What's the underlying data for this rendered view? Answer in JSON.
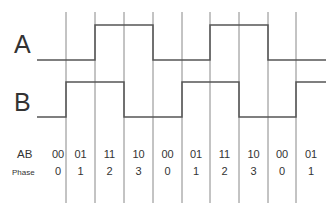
{
  "diagram": {
    "signals": [
      {
        "name": "A",
        "levels": [
          0,
          0,
          1,
          1,
          0,
          0,
          1,
          1,
          0,
          0
        ]
      },
      {
        "name": "B",
        "levels": [
          0,
          1,
          1,
          0,
          0,
          1,
          1,
          0,
          0,
          1
        ]
      }
    ],
    "rows": {
      "ab_label": "AB",
      "phase_label": "Phase",
      "ab_values": [
        "00",
        "01",
        "11",
        "10",
        "00",
        "01",
        "11",
        "10",
        "00",
        "01"
      ],
      "phase_values": [
        "0",
        "1",
        "2",
        "3",
        "0",
        "1",
        "2",
        "3",
        "0",
        "1"
      ]
    },
    "colors": {
      "wave": "#555555",
      "divider": "#888888",
      "text": "#333333"
    }
  }
}
